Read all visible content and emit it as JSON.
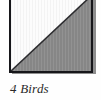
{
  "figure": {
    "caption": "4 Birds",
    "background_color": "#fefefe"
  },
  "block": {
    "name": "half-square-triangle-quilt-block",
    "outline_color": "#16161a",
    "shadow_color": "#8e8e8e",
    "seam_color": "#2b2b2e",
    "patches": [
      {
        "position": "upper-left",
        "shape": "triangle",
        "fabric": "light",
        "color": "#fcfcfc"
      },
      {
        "position": "lower-right",
        "shape": "triangle",
        "fabric": "dark",
        "color": "#868686"
      }
    ]
  }
}
